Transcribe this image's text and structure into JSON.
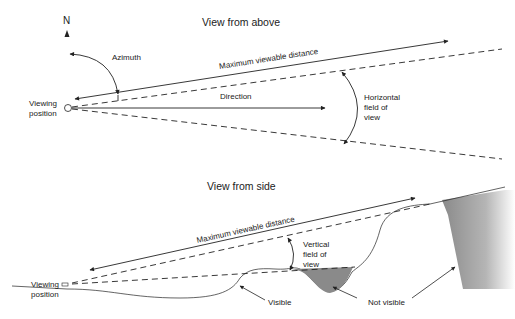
{
  "top_view": {
    "title": "View from above",
    "north_label": "N",
    "azimuth_label": "Azimuth",
    "max_distance_label": "Maximum viewable distance",
    "direction_label": "Direction",
    "hfov_label_lines": [
      "Horizontal",
      "field of",
      "view"
    ],
    "viewing_position_lines": [
      "Viewing",
      "position"
    ]
  },
  "side_view": {
    "title": "View from side",
    "max_distance_label": "Maximum viewable distance",
    "vfov_label_lines": [
      "Vertical",
      "field of",
      "view"
    ],
    "viewing_position_lines": [
      "Viewing",
      "position"
    ],
    "visible_label": "Visible",
    "not_visible_label": "Not visible"
  },
  "colors": {
    "line": "#222222",
    "shade": "#8a8a8a"
  }
}
